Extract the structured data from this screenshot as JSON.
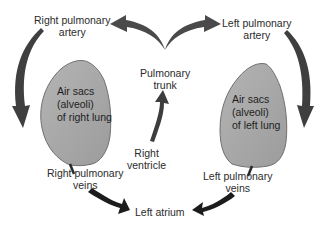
{
  "diagram": {
    "title": "",
    "type": "pulmonary circulation flow",
    "colors": {
      "background": "#ffffff",
      "lung_fill": "#a9a9a9",
      "lung_stroke": "#6e6e6e",
      "arrow_dark": "#1c1c1c",
      "arrow_mid": "#4a4a4a",
      "text": "#2b2b2b"
    },
    "labels": {
      "right_pulmonary_artery": "Right pulmonary\nartery",
      "left_pulmonary_artery": "Left pulmonary\nartery",
      "pulmonary_trunk": "Pulmonary\ntrunk",
      "right_ventricle": "Right\nventricle",
      "right_lung": "Air sacs\n(alveoli)\nof right lung",
      "left_lung": "Air sacs\n(alveoli)\nof left lung",
      "right_pulmonary_veins": "Right pulmonary\nveins",
      "left_pulmonary_veins": "Left pulmonary\nveins",
      "left_atrium": "Left atrium"
    },
    "flow": [
      {
        "from": "Right ventricle",
        "to": "Pulmonary trunk"
      },
      {
        "from": "Pulmonary trunk",
        "to": "Right pulmonary artery"
      },
      {
        "from": "Pulmonary trunk",
        "to": "Left pulmonary artery"
      },
      {
        "from": "Right pulmonary artery",
        "to": "Air sacs (alveoli) of right lung"
      },
      {
        "from": "Left pulmonary artery",
        "to": "Air sacs (alveoli) of left lung"
      },
      {
        "from": "Right pulmonary veins",
        "to": "Left atrium"
      },
      {
        "from": "Left pulmonary veins",
        "to": "Left atrium"
      }
    ]
  }
}
